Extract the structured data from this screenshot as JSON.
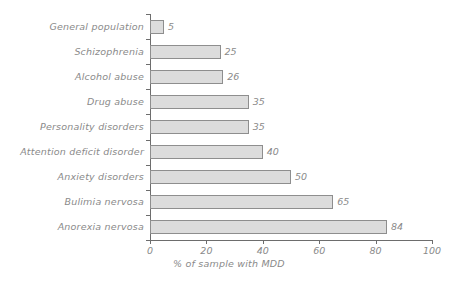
{
  "chart_data": {
    "type": "bar",
    "orientation": "horizontal",
    "title": "",
    "xlabel": "% of sample with MDD",
    "ylabel": "",
    "xlim": [
      0,
      100
    ],
    "xticks": [
      0,
      20,
      40,
      60,
      80,
      100
    ],
    "xtick_labels": [
      "0",
      "20",
      "40",
      "60",
      "80",
      "100"
    ],
    "grid": false,
    "legend": null,
    "value_labels_shown": true,
    "categories": [
      "General population",
      "Schizophrenia",
      "Alcohol abuse",
      "Drug abuse",
      "Personality disorders",
      "Attention deficit disorder",
      "Anxiety disorders",
      "Bulimia nervosa",
      "Anorexia nervosa"
    ],
    "values": [
      5,
      25,
      26,
      35,
      35,
      40,
      50,
      65,
      84
    ],
    "bars": [
      {
        "category": "General population",
        "value": 5,
        "label": "5"
      },
      {
        "category": "Schizophrenia",
        "value": 25,
        "label": "25"
      },
      {
        "category": "Alcohol abuse",
        "value": 26,
        "label": "26"
      },
      {
        "category": "Drug abuse",
        "value": 35,
        "label": "35"
      },
      {
        "category": "Personality disorders",
        "value": 35,
        "label": "35"
      },
      {
        "category": "Attention deficit disorder",
        "value": 40,
        "label": "40"
      },
      {
        "category": "Anxiety disorders",
        "value": 50,
        "label": "50"
      },
      {
        "category": "Bulimia nervosa",
        "value": 65,
        "label": "65"
      },
      {
        "category": "Anorexia nervosa",
        "value": 84,
        "label": "84"
      }
    ],
    "colors": {
      "background": "#ffffff",
      "bar_fill": "#dcdcdc",
      "bar_stroke": "#8e8e8e",
      "axis": "#6d6d6d",
      "text": "#8a8a8a"
    }
  }
}
